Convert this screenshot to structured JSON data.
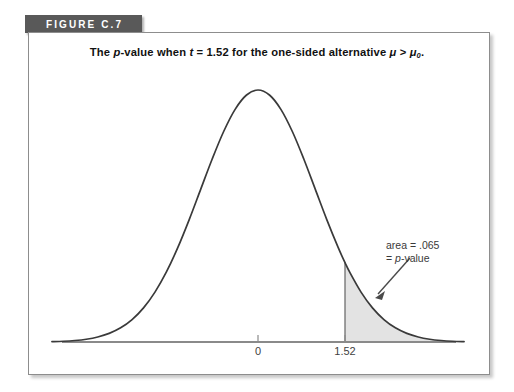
{
  "figure": {
    "banner_label": "FIGURE C.7",
    "banner_color": "#595959",
    "banner_text_color": "#ffffff"
  },
  "title": {
    "prefix": "The ",
    "p_italic": "p",
    "mid1": "-value when ",
    "t_italic": "t",
    "mid2": " = 1.52 for the one-sided alternative ",
    "mu_italic": "μ",
    "mid3": " > ",
    "mu0_italic": "μ",
    "mu0_sub": "0",
    "suffix": ".",
    "full_text": "The p-value when t = 1.52 for the one-sided alternative μ > μ0."
  },
  "annotation": {
    "line1": "area = .065",
    "line2_prefix": "= ",
    "line2_italic": "p",
    "line2_suffix": "-value",
    "arrow": "arrow pointing down-left to shaded tail"
  },
  "axis": {
    "tick_labels": [
      "0",
      "1.52"
    ],
    "tick_values": [
      0,
      1.52
    ]
  },
  "colors": {
    "curve": "#3a3a3a",
    "shade_fill": "#e3e3e3",
    "shade_edge": "#6f6f6f",
    "axis": "#8a8a8a",
    "frame": "#8d8d8d",
    "annotation_text": "#3a3a3a"
  },
  "chart_data": {
    "type": "area",
    "title": "The p-value when t = 1.52 for the one-sided alternative μ > μ0.",
    "xlabel": "",
    "ylabel": "",
    "distribution": "t-distribution (bell-shaped density curve)",
    "x_ticks": [
      0,
      1.52
    ],
    "x_tick_labels": [
      "0",
      "1.52"
    ],
    "xlim": [
      -3.6,
      3.6
    ],
    "ylim": [
      0,
      0.42
    ],
    "grid": false,
    "legend": "none",
    "shaded_region": {
      "label": "area = .065 = p-value",
      "from": 1.52,
      "to": 3.6,
      "area": 0.065,
      "fill": "#e3e3e3",
      "tail": "upper"
    },
    "annotations": [
      {
        "text": "area = .065",
        "x": 2.4,
        "y": 0.26
      },
      {
        "text": "= p-value",
        "x": 2.5,
        "y": 0.23
      }
    ],
    "x": [
      -3.6,
      -3.4,
      -3.2,
      -3.0,
      -2.8,
      -2.6,
      -2.4,
      -2.2,
      -2.0,
      -1.8,
      -1.6,
      -1.4,
      -1.2,
      -1.0,
      -0.8,
      -0.6,
      -0.4,
      -0.2,
      0.0,
      0.2,
      0.4,
      0.6,
      0.8,
      1.0,
      1.2,
      1.4,
      1.52,
      1.6,
      1.8,
      2.0,
      2.2,
      2.4,
      2.6,
      2.8,
      3.0,
      3.2,
      3.4,
      3.6
    ],
    "y": [
      0.0006,
      0.0012,
      0.0024,
      0.0044,
      0.0079,
      0.0136,
      0.0224,
      0.0355,
      0.054,
      0.079,
      0.1109,
      0.1497,
      0.1942,
      0.242,
      0.2897,
      0.3332,
      0.3683,
      0.391,
      0.3989,
      0.391,
      0.3683,
      0.3332,
      0.2897,
      0.242,
      0.1942,
      0.1497,
      0.1257,
      0.1109,
      0.079,
      0.054,
      0.0355,
      0.0224,
      0.0136,
      0.0079,
      0.0044,
      0.0024,
      0.0012,
      0.0006
    ]
  }
}
